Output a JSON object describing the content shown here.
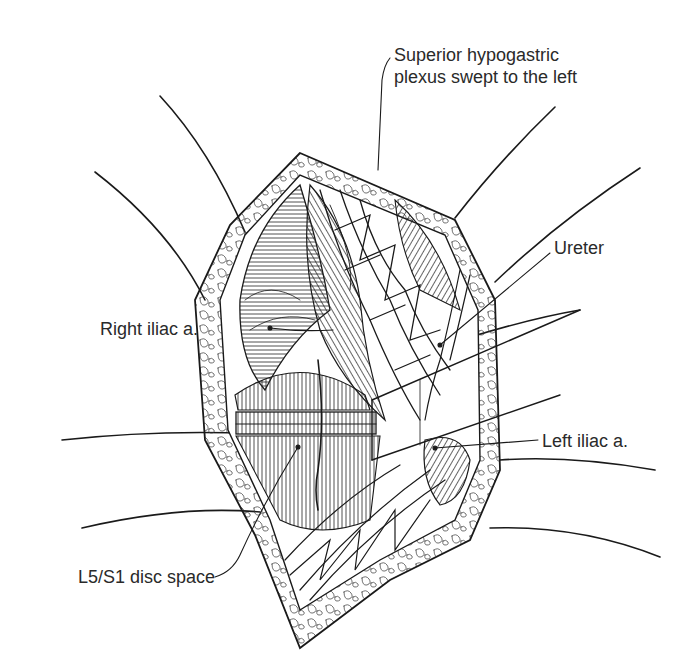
{
  "figure": {
    "type": "surgical anatomical line illustration",
    "labels": {
      "superior_hypogastric_line1": "Superior hypogastric",
      "superior_hypogastric_line2": "plexus swept to the left",
      "ureter": "Ureter",
      "right_iliac": "Right iliac a.",
      "left_iliac": "Left iliac a.",
      "disc_space": "L5/S1 disc space"
    },
    "colors": {
      "ink": "#1a1a1a",
      "background": "#ffffff",
      "text": "#2a2a2a"
    }
  }
}
